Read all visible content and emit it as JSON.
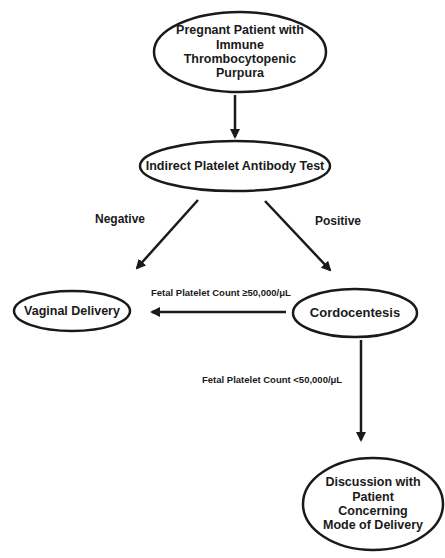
{
  "diagram": {
    "type": "flowchart",
    "nodes": {
      "start": {
        "label": "Pregnant Patient with Immune Thrombocytopenic Purpura",
        "lines": [
          "Pregnant Patient with",
          "Immune Thrombocytopenic",
          "Purpura"
        ]
      },
      "test": {
        "label": "Indirect Platelet Antibody Test"
      },
      "vaginal": {
        "label": "Vaginal Delivery"
      },
      "cordo": {
        "label": "Cordocentesis"
      },
      "discussion": {
        "label": "Discussion with Patient Concerning Mode of Delivery",
        "lines": [
          "Discussion with",
          "Patient",
          "Concerning",
          "Mode of Delivery"
        ]
      }
    },
    "edges": {
      "negative": {
        "from": "test",
        "to": "vaginal",
        "label": "Negative"
      },
      "positive": {
        "from": "test",
        "to": "cordo",
        "label": "Positive"
      },
      "high_count": {
        "from": "cordo",
        "to": "vaginal",
        "label": "Fetal Platelet Count ≥50,000/μL"
      },
      "low_count": {
        "from": "cordo",
        "to": "discussion",
        "label": "Fetal Platelet Count <50,000/μL"
      }
    },
    "colors": {
      "stroke": "#1a1a1a",
      "background": "#ffffff"
    }
  }
}
